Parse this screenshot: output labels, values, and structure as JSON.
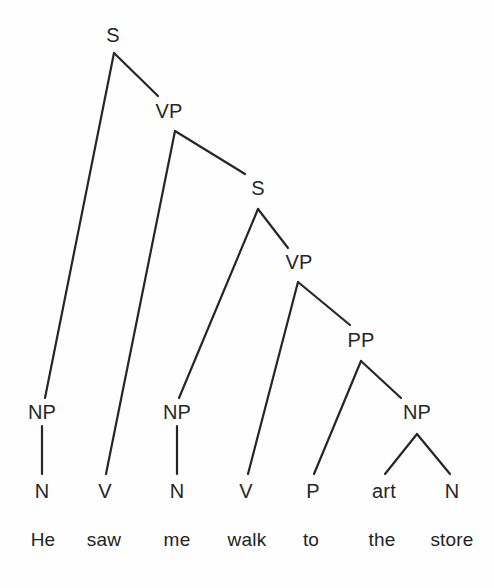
{
  "figure": {
    "kind": "syntax-tree-diagram",
    "sentence": "He saw me walk to the store",
    "background_color": "#fefefe",
    "line_color": "#262626",
    "text_color": "#262626",
    "width": 494,
    "height": 588
  },
  "nodes": [
    {
      "id": "S1",
      "label": "S",
      "x": 113,
      "y": 35,
      "level": "phrase"
    },
    {
      "id": "VP1",
      "label": "VP",
      "x": 169,
      "y": 111,
      "level": "phrase"
    },
    {
      "id": "S2",
      "label": "S",
      "x": 258,
      "y": 188,
      "level": "phrase"
    },
    {
      "id": "VP2",
      "label": "VP",
      "x": 299,
      "y": 262,
      "level": "phrase"
    },
    {
      "id": "PP1",
      "label": "PP",
      "x": 361,
      "y": 340,
      "level": "phrase"
    },
    {
      "id": "NP1",
      "label": "NP",
      "x": 42,
      "y": 412,
      "level": "phrase"
    },
    {
      "id": "NP2",
      "label": "NP",
      "x": 177,
      "y": 412,
      "level": "phrase"
    },
    {
      "id": "NP3",
      "label": "NP",
      "x": 417,
      "y": 412,
      "level": "phrase"
    },
    {
      "id": "N1",
      "label": "N",
      "x": 42,
      "y": 491,
      "level": "pos"
    },
    {
      "id": "V1",
      "label": "V",
      "x": 105,
      "y": 491,
      "level": "pos"
    },
    {
      "id": "N2",
      "label": "N",
      "x": 177,
      "y": 491,
      "level": "pos"
    },
    {
      "id": "V2",
      "label": "V",
      "x": 246,
      "y": 491,
      "level": "pos"
    },
    {
      "id": "P1",
      "label": "P",
      "x": 313,
      "y": 491,
      "level": "pos"
    },
    {
      "id": "ART",
      "label": "art",
      "x": 384,
      "y": 491,
      "level": "pos"
    },
    {
      "id": "N3",
      "label": "N",
      "x": 452,
      "y": 491,
      "level": "pos"
    }
  ],
  "words": [
    {
      "id": "W1",
      "text": "He",
      "x": 43,
      "y": 539
    },
    {
      "id": "W2",
      "text": "saw",
      "x": 104,
      "y": 539
    },
    {
      "id": "W3",
      "text": "me",
      "x": 177,
      "y": 539
    },
    {
      "id": "W4",
      "text": "walk",
      "x": 247,
      "y": 539
    },
    {
      "id": "W5",
      "text": "to",
      "x": 311,
      "y": 539
    },
    {
      "id": "W6",
      "text": "the",
      "x": 382,
      "y": 539
    },
    {
      "id": "W7",
      "text": "store",
      "x": 452,
      "y": 539
    }
  ],
  "edges": [
    {
      "from": "S1",
      "to": "NP1",
      "x1": 114,
      "y1": 53,
      "x2": 45,
      "y2": 398
    },
    {
      "from": "S1",
      "to": "VP1",
      "x1": 114,
      "y1": 53,
      "x2": 158,
      "y2": 96
    },
    {
      "from": "VP1",
      "to": "V1",
      "x1": 175,
      "y1": 131,
      "x2": 106,
      "y2": 474
    },
    {
      "from": "VP1",
      "to": "S2",
      "x1": 175,
      "y1": 131,
      "x2": 245,
      "y2": 174
    },
    {
      "from": "S2",
      "to": "NP2",
      "x1": 258,
      "y1": 209,
      "x2": 179,
      "y2": 398
    },
    {
      "from": "S2",
      "to": "VP2",
      "x1": 258,
      "y1": 209,
      "x2": 288,
      "y2": 248
    },
    {
      "from": "VP2",
      "to": "V2",
      "x1": 298,
      "y1": 282,
      "x2": 248,
      "y2": 474
    },
    {
      "from": "VP2",
      "to": "PP1",
      "x1": 298,
      "y1": 282,
      "x2": 350,
      "y2": 325
    },
    {
      "from": "PP1",
      "to": "P1",
      "x1": 361,
      "y1": 361,
      "x2": 314,
      "y2": 474
    },
    {
      "from": "PP1",
      "to": "NP3",
      "x1": 361,
      "y1": 361,
      "x2": 401,
      "y2": 398
    },
    {
      "from": "NP1",
      "to": "N1",
      "x1": 42,
      "y1": 426,
      "x2": 42,
      "y2": 474
    },
    {
      "from": "NP2",
      "to": "N2",
      "x1": 177,
      "y1": 426,
      "x2": 177,
      "y2": 474
    },
    {
      "from": "NP3",
      "to": "ART",
      "x1": 417,
      "y1": 434,
      "x2": 385,
      "y2": 474
    },
    {
      "from": "NP3",
      "to": "N3",
      "x1": 417,
      "y1": 434,
      "x2": 450,
      "y2": 474
    }
  ]
}
